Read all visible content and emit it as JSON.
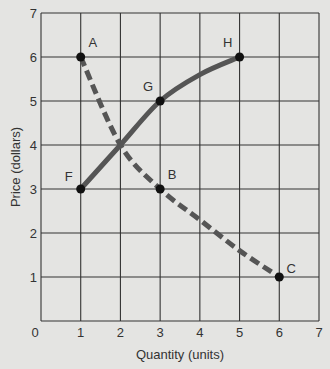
{
  "chart_data": {
    "type": "line",
    "title": "",
    "xlabel": "Quantity (units)",
    "ylabel": "Price (dollars)",
    "xlim": [
      0,
      7
    ],
    "ylim": [
      0,
      7
    ],
    "grid": true,
    "x_ticks": [
      "0",
      "1",
      "2",
      "3",
      "4",
      "5",
      "6",
      "7"
    ],
    "y_ticks": [
      "1",
      "2",
      "3",
      "4",
      "5",
      "6",
      "7"
    ],
    "series": [
      {
        "name": "dashed curve A-B-C",
        "style": "dashed",
        "points": [
          {
            "label": "A",
            "x": 1,
            "y": 6
          },
          {
            "label": "",
            "x": 2,
            "y": 4
          },
          {
            "label": "B",
            "x": 3,
            "y": 3
          },
          {
            "label": "",
            "x": 4,
            "y": 2.3
          },
          {
            "label": "",
            "x": 5,
            "y": 1.6
          },
          {
            "label": "C",
            "x": 6,
            "y": 1
          }
        ]
      },
      {
        "name": "solid curve F-G-H",
        "style": "solid",
        "points": [
          {
            "label": "F",
            "x": 1,
            "y": 3
          },
          {
            "label": "",
            "x": 2,
            "y": 4
          },
          {
            "label": "G",
            "x": 3,
            "y": 5
          },
          {
            "label": "",
            "x": 4,
            "y": 5.6
          },
          {
            "label": "H",
            "x": 5,
            "y": 6
          }
        ]
      }
    ],
    "annotations": [
      "A",
      "B",
      "C",
      "F",
      "G",
      "H"
    ],
    "colors": {
      "background": "#e4e4e2",
      "curve": "#555555",
      "grid": "#333333",
      "point": "#111111"
    }
  }
}
